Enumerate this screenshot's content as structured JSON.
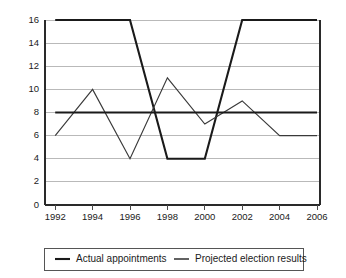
{
  "chart_data": {
    "type": "line",
    "title": "",
    "subtitle": "",
    "xlabel": "",
    "ylabel": "",
    "categories": [
      1992,
      1994,
      1996,
      1998,
      2000,
      2002,
      2004,
      2006
    ],
    "x": [
      1992,
      1994,
      1996,
      1998,
      2000,
      2002,
      2004,
      2006
    ],
    "xlim": [
      1992,
      2006
    ],
    "ylim": [
      0,
      16
    ],
    "y_ticks": [
      0,
      2,
      4,
      6,
      8,
      10,
      12,
      14,
      16
    ],
    "x_ticks": [
      1992,
      1994,
      1996,
      1998,
      2000,
      2002,
      2004,
      2006
    ],
    "y_tick_labels": [
      "0",
      "2",
      "4",
      "6",
      "8",
      "10",
      "12",
      "14",
      "16"
    ],
    "x_tick_labels": [
      "1992",
      "1994",
      "1996",
      "1998",
      "2000",
      "2002",
      "2004",
      "2006"
    ],
    "grid": "horizontal",
    "legend_position": "bottom",
    "series": [
      {
        "name": "Actual appointments",
        "color": "#1a1a1a",
        "values": [
          8,
          8,
          8,
          8,
          8,
          8,
          8,
          8
        ]
      },
      {
        "name": "Projected election results",
        "color": "#3a3a3a",
        "values": [
          6,
          10,
          4,
          11,
          7,
          9,
          6,
          6
        ]
      },
      {
        "name": "Actual appointments",
        "color": "#1a1a1a",
        "values": [
          16,
          16,
          16,
          4,
          4,
          16,
          16,
          16
        ]
      }
    ]
  },
  "legend": {
    "entries": [
      {
        "label": "Actual appointments",
        "swatch": "line-swatch-dark"
      },
      {
        "label": "Projected election results",
        "swatch": "line-swatch-light"
      }
    ]
  },
  "axis_ticks": {
    "y": [
      "16",
      "14",
      "12",
      "10",
      "8",
      "6",
      "4",
      "2",
      "0"
    ],
    "x": [
      "1992",
      "1994",
      "1996",
      "1998",
      "2000",
      "2002",
      "2004",
      "2006"
    ]
  }
}
